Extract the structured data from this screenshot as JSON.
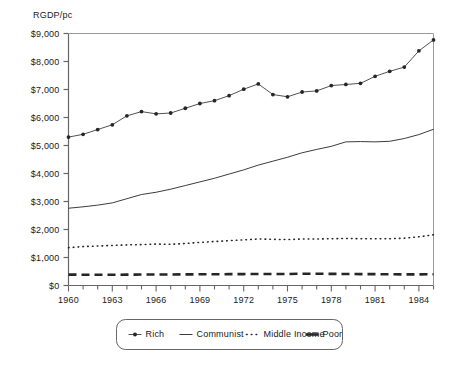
{
  "chart_data": {
    "type": "line",
    "title": "",
    "ylabel": "RGDP/pc",
    "xlabel": "",
    "ylim": [
      0,
      9000
    ],
    "xlim": [
      1960,
      1985
    ],
    "grid": false,
    "legend_position": "bottom",
    "y_ticks": [
      0,
      1000,
      2000,
      3000,
      4000,
      5000,
      6000,
      7000,
      8000,
      9000
    ],
    "y_tick_labels": [
      "$0",
      "$1,000",
      "$2,000",
      "$3,000",
      "$4,000",
      "$5,000",
      "$6,000",
      "$7,000",
      "$8,000",
      "$9,000"
    ],
    "x_ticks": [
      1960,
      1963,
      1966,
      1969,
      1972,
      1975,
      1978,
      1981,
      1984
    ],
    "x_tick_labels": [
      "1960",
      "1963",
      "1966",
      "1969",
      "1972",
      "1975",
      "1978",
      "1981",
      "1984"
    ],
    "x": [
      1960,
      1961,
      1962,
      1963,
      1964,
      1965,
      1966,
      1967,
      1968,
      1969,
      1970,
      1971,
      1972,
      1973,
      1974,
      1975,
      1976,
      1977,
      1978,
      1979,
      1980,
      1981,
      1982,
      1983,
      1984,
      1985
    ],
    "series": [
      {
        "name": "Rich",
        "style": "solid-markers",
        "marker": "dot",
        "values": [
          5300,
          5400,
          5570,
          5740,
          6060,
          6210,
          6130,
          6160,
          6330,
          6500,
          6600,
          6780,
          7010,
          7200,
          6820,
          6740,
          6910,
          6950,
          7140,
          7180,
          7220,
          7470,
          7650,
          7800,
          8380,
          8770
        ]
      },
      {
        "name": "Communist",
        "style": "solid",
        "values": [
          2760,
          2810,
          2870,
          2950,
          3100,
          3250,
          3330,
          3440,
          3570,
          3700,
          3830,
          3980,
          4130,
          4300,
          4440,
          4580,
          4740,
          4860,
          4970,
          5130,
          5140,
          5130,
          5150,
          5250,
          5390,
          5580
        ]
      },
      {
        "name": "Middle Income",
        "style": "dotted",
        "values": [
          1350,
          1390,
          1410,
          1430,
          1450,
          1460,
          1480,
          1470,
          1500,
          1540,
          1570,
          1600,
          1630,
          1660,
          1650,
          1640,
          1660,
          1660,
          1670,
          1680,
          1670,
          1670,
          1670,
          1690,
          1740,
          1810
        ]
      },
      {
        "name": "Poor",
        "style": "dashed",
        "values": [
          390,
          385,
          385,
          385,
          388,
          392,
          395,
          392,
          398,
          400,
          402,
          405,
          408,
          412,
          410,
          412,
          420,
          422,
          415,
          412,
          408,
          405,
          400,
          398,
          398,
          400
        ]
      }
    ]
  },
  "legend": {
    "items": [
      {
        "label": "Rich",
        "swatch": "line-with-dot-marker"
      },
      {
        "label": "Communist",
        "swatch": "solid-line"
      },
      {
        "label": "Middle Income",
        "swatch": "dotted-line"
      },
      {
        "label": "Poor",
        "swatch": "thick-dashed-line"
      }
    ]
  },
  "colors": {
    "line": "#262626",
    "axis": "#666666",
    "background": "#ffffff"
  }
}
